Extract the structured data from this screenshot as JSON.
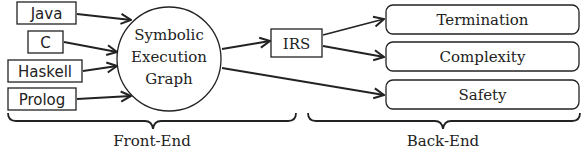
{
  "diagram": {
    "inputs": [
      {
        "label": "Java"
      },
      {
        "label": "C"
      },
      {
        "label": "Haskell"
      },
      {
        "label": "Prolog"
      }
    ],
    "central_node": {
      "lines": [
        "Symbolic",
        "Execution",
        "Graph"
      ]
    },
    "intermediate_node": {
      "label": "IRS"
    },
    "outputs": [
      {
        "label": "Termination"
      },
      {
        "label": "Complexity"
      },
      {
        "label": "Safety"
      }
    ],
    "groups": {
      "front_end": {
        "label": "Front-End"
      },
      "back_end": {
        "label": "Back-End"
      }
    },
    "colors": {
      "stroke": "#222222",
      "text": "#222222",
      "background": "#ffffff"
    }
  }
}
